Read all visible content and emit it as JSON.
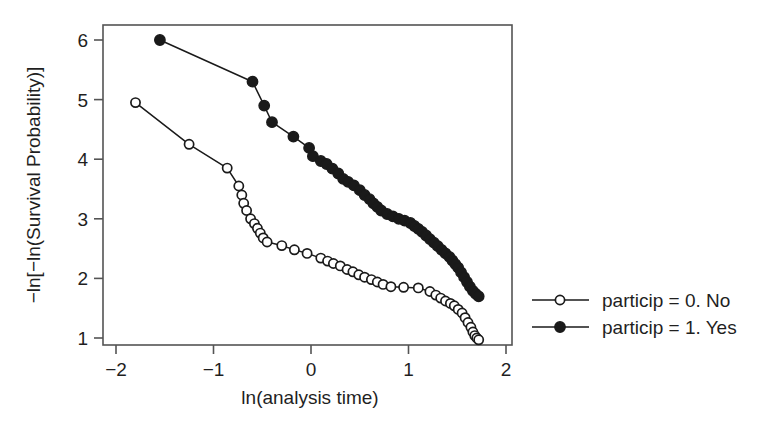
{
  "figure": {
    "background_color": "#ffffff",
    "ink_color": "#1a1a1a",
    "frame_color": "#545454"
  },
  "chart_data": {
    "type": "scatter",
    "title": "",
    "subtitle": "",
    "xlabel": "ln(analysis time)",
    "ylabel": "−ln[−ln(Survival Probability)]",
    "xlim": [
      -2.2,
      2.0
    ],
    "ylim": [
      0.75,
      6.35
    ],
    "xticks": [
      -2,
      -1,
      0,
      1,
      2
    ],
    "xticklabels": [
      "−2",
      "−1",
      "0",
      "1",
      "2"
    ],
    "yticks": [
      1,
      2,
      3,
      4,
      5,
      6
    ],
    "yticklabels": [
      "1",
      "2",
      "3",
      "4",
      "5",
      "6"
    ],
    "grid": false,
    "legend_position": "right-outside",
    "marker_style": "connected-markers",
    "series": [
      {
        "name": "particip = 0. No",
        "marker": "open-circle",
        "color": "#1a1a1a",
        "points": [
          [
            -1.8,
            4.95
          ],
          [
            -1.25,
            4.25
          ],
          [
            -0.86,
            3.85
          ],
          [
            -0.74,
            3.55
          ],
          [
            -0.71,
            3.4
          ],
          [
            -0.69,
            3.26
          ],
          [
            -0.66,
            3.14
          ],
          [
            -0.62,
            3.0
          ],
          [
            -0.58,
            2.92
          ],
          [
            -0.55,
            2.84
          ],
          [
            -0.52,
            2.76
          ],
          [
            -0.49,
            2.68
          ],
          [
            -0.45,
            2.61
          ],
          [
            -0.3,
            2.55
          ],
          [
            -0.17,
            2.48
          ],
          [
            -0.04,
            2.42
          ],
          [
            0.1,
            2.34
          ],
          [
            0.17,
            2.29
          ],
          [
            0.23,
            2.25
          ],
          [
            0.3,
            2.21
          ],
          [
            0.37,
            2.15
          ],
          [
            0.43,
            2.11
          ],
          [
            0.49,
            2.06
          ],
          [
            0.55,
            2.02
          ],
          [
            0.62,
            1.98
          ],
          [
            0.68,
            1.94
          ],
          [
            0.74,
            1.9
          ],
          [
            0.82,
            1.86
          ],
          [
            0.95,
            1.85
          ],
          [
            1.1,
            1.84
          ],
          [
            1.22,
            1.78
          ],
          [
            1.28,
            1.72
          ],
          [
            1.33,
            1.67
          ],
          [
            1.38,
            1.62
          ],
          [
            1.43,
            1.58
          ],
          [
            1.47,
            1.54
          ],
          [
            1.51,
            1.48
          ],
          [
            1.55,
            1.42
          ],
          [
            1.58,
            1.34
          ],
          [
            1.61,
            1.26
          ],
          [
            1.64,
            1.18
          ],
          [
            1.66,
            1.1
          ],
          [
            1.68,
            1.04
          ],
          [
            1.7,
            1.0
          ],
          [
            1.72,
            0.97
          ]
        ]
      },
      {
        "name": "particip = 1. Yes",
        "marker": "filled-circle",
        "color": "#1a1a1a",
        "points": [
          [
            -1.55,
            6.0
          ],
          [
            -0.6,
            5.3
          ],
          [
            -0.48,
            4.9
          ],
          [
            -0.4,
            4.62
          ],
          [
            -0.18,
            4.38
          ],
          [
            -0.02,
            4.19
          ],
          [
            0.02,
            4.05
          ],
          [
            0.1,
            3.97
          ],
          [
            0.16,
            3.92
          ],
          [
            0.22,
            3.84
          ],
          [
            0.28,
            3.76
          ],
          [
            0.33,
            3.67
          ],
          [
            0.38,
            3.62
          ],
          [
            0.44,
            3.56
          ],
          [
            0.5,
            3.48
          ],
          [
            0.55,
            3.4
          ],
          [
            0.6,
            3.33
          ],
          [
            0.64,
            3.26
          ],
          [
            0.68,
            3.2
          ],
          [
            0.72,
            3.14
          ],
          [
            0.78,
            3.08
          ],
          [
            0.84,
            3.04
          ],
          [
            0.9,
            3.0
          ],
          [
            0.96,
            2.97
          ],
          [
            1.02,
            2.93
          ],
          [
            1.06,
            2.88
          ],
          [
            1.1,
            2.83
          ],
          [
            1.14,
            2.78
          ],
          [
            1.18,
            2.72
          ],
          [
            1.22,
            2.66
          ],
          [
            1.26,
            2.6
          ],
          [
            1.3,
            2.54
          ],
          [
            1.34,
            2.48
          ],
          [
            1.38,
            2.42
          ],
          [
            1.42,
            2.36
          ],
          [
            1.45,
            2.3
          ],
          [
            1.48,
            2.24
          ],
          [
            1.51,
            2.18
          ],
          [
            1.54,
            2.1
          ],
          [
            1.57,
            2.02
          ],
          [
            1.6,
            1.94
          ],
          [
            1.63,
            1.86
          ],
          [
            1.66,
            1.79
          ],
          [
            1.69,
            1.74
          ],
          [
            1.72,
            1.7
          ]
        ]
      }
    ]
  },
  "legend": {
    "entries": [
      {
        "label": "particip = 0. No",
        "marker": "open-circle"
      },
      {
        "label": "particip = 1. Yes",
        "marker": "filled-circle"
      }
    ]
  }
}
